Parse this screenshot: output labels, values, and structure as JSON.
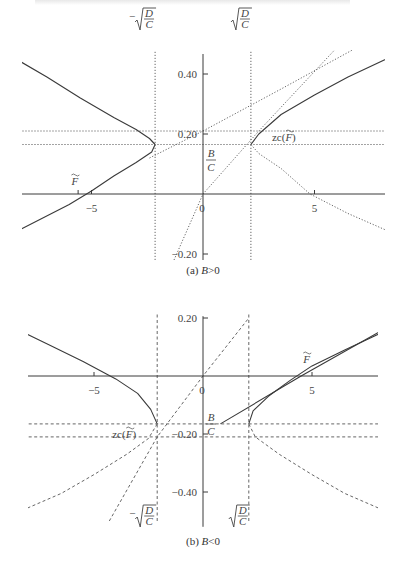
{
  "header_text_fragment": "",
  "chart_data": [
    {
      "type": "line",
      "panel": "a",
      "caption": "(a) B>0",
      "caption_prefix": "(a) ",
      "caption_var": "B",
      "caption_rel": ">0",
      "xlim": [
        -8.5,
        8.5
      ],
      "ylim": [
        -0.22,
        0.48
      ],
      "x_ticks": [
        -5,
        0,
        5
      ],
      "x_tick_labels": [
        "−5",
        "0",
        "5"
      ],
      "y_ticks": [
        0.4,
        0.2,
        -0.2
      ],
      "y_tick_labels": [
        "0.40",
        "0.20",
        "−0.20"
      ],
      "params": {
        "sqrtDC": 2.15,
        "BC": 0.165,
        "zc_y": 0.21
      },
      "annotations": {
        "neg_sqrt": "−√(D/C)",
        "pos_sqrt": "√(D/C)",
        "BC_num": "B",
        "BC_den": "C",
        "zc": "zc(F̃)",
        "Ftilde": "F̃"
      },
      "series": [
        {
          "name": "hyperbola-left-solid",
          "style": "solid",
          "points": [
            [
              -8.5,
              0.455
            ],
            [
              -7,
              0.39
            ],
            [
              -5.5,
              0.32
            ],
            [
              -4,
              0.255
            ],
            [
              -3,
              0.215
            ],
            [
              -2.4,
              0.185
            ],
            [
              -2.15,
              0.165
            ]
          ]
        },
        {
          "name": "hyperbola-left-lower",
          "style": "mixed",
          "points": [
            [
              -2.15,
              0.165
            ],
            [
              -2.3,
              0.14
            ],
            [
              -3,
              0.105
            ],
            [
              -4,
              0.06
            ],
            [
              -5,
              0.01
            ],
            [
              -6,
              -0.035
            ],
            [
              -8.5,
              -0.13
            ]
          ]
        },
        {
          "name": "hyperbola-right-solid",
          "style": "solid",
          "points": [
            [
              2.15,
              0.165
            ],
            [
              2.5,
              0.2
            ],
            [
              3.5,
              0.265
            ],
            [
              5,
              0.33
            ],
            [
              6.5,
              0.39
            ],
            [
              8.5,
              0.46
            ]
          ]
        },
        {
          "name": "hyperbola-right-lower",
          "style": "dotted",
          "points": [
            [
              2.15,
              0.165
            ],
            [
              2.5,
              0.135
            ],
            [
              3.5,
              0.085
            ],
            [
              4.8,
              0.0
            ],
            [
              6.5,
              -0.065
            ],
            [
              8.5,
              -0.13
            ]
          ]
        },
        {
          "name": "tangent-line-steep",
          "style": "dotted",
          "points": [
            [
              -1.3,
              -0.22
            ],
            [
              0,
              0
            ],
            [
              2.5,
              0.21
            ],
            [
              5.9,
              0.48
            ]
          ]
        },
        {
          "name": "tangent-line-shallow",
          "style": "dotted",
          "points": [
            [
              -2.4,
              0.12
            ],
            [
              0,
              0.21
            ],
            [
              3.5,
              0.35
            ],
            [
              6.7,
              0.48
            ]
          ]
        },
        {
          "name": "hline-zc",
          "style": "dotted",
          "points": [
            [
              -8.5,
              0.21
            ],
            [
              8.5,
              0.21
            ]
          ]
        },
        {
          "name": "hline-BC",
          "style": "dotted",
          "points": [
            [
              -8.5,
              0.165
            ],
            [
              8.5,
              0.165
            ]
          ]
        },
        {
          "name": "vline-neg-sqrt",
          "style": "dotted",
          "points": [
            [
              -2.15,
              -0.22
            ],
            [
              -2.15,
              0.48
            ]
          ]
        },
        {
          "name": "vline-pos-sqrt",
          "style": "dotted",
          "points": [
            [
              2.15,
              -0.22
            ],
            [
              2.15,
              0.48
            ]
          ]
        }
      ]
    },
    {
      "type": "line",
      "panel": "b",
      "caption": "(b) B<0",
      "caption_prefix": "(b) ",
      "caption_var": "B",
      "caption_rel": "<0",
      "xlim": [
        -8.5,
        8.5
      ],
      "ylim": [
        -0.52,
        0.22
      ],
      "x_ticks": [
        -5,
        0,
        5
      ],
      "x_tick_labels": [
        "−5",
        "0",
        "5"
      ],
      "y_ticks": [
        0.2,
        -0.2,
        -0.4
      ],
      "y_tick_labels": [
        "0.20",
        "−0.20",
        "−0.40"
      ],
      "params": {
        "sqrtDC": 2.1,
        "BC": -0.165,
        "zc_y": -0.21
      },
      "annotations": {
        "neg_sqrt": "−√(D/C)",
        "pos_sqrt": "√(D/C)",
        "BC_num": "B",
        "BC_den": "C",
        "zc": "zc(F̃)",
        "Ftilde": "F̃"
      },
      "series": [
        {
          "name": "hyperbola-left-solid",
          "style": "solid",
          "points": [
            [
              -8.5,
              0.16
            ],
            [
              -7,
              0.105
            ],
            [
              -5.5,
              0.05
            ],
            [
              -4,
              -0.01
            ],
            [
              -3,
              -0.06
            ],
            [
              -2.4,
              -0.115
            ],
            [
              -2.1,
              -0.165
            ]
          ]
        },
        {
          "name": "hyperbola-left-lower",
          "style": "dashed",
          "points": [
            [
              -2.1,
              -0.165
            ],
            [
              -2.5,
              -0.215
            ],
            [
              -3.5,
              -0.27
            ],
            [
              -5,
              -0.34
            ],
            [
              -6.5,
              -0.405
            ],
            [
              -8.5,
              -0.47
            ]
          ]
        },
        {
          "name": "hyperbola-right-solid",
          "style": "solid",
          "points": [
            [
              2.1,
              -0.165
            ],
            [
              2.3,
              -0.12
            ],
            [
              3,
              -0.07
            ],
            [
              4,
              -0.015
            ],
            [
              5,
              0.035
            ],
            [
              6.5,
              0.09
            ],
            [
              8.5,
              0.16
            ]
          ]
        },
        {
          "name": "hyperbola-right-lower",
          "style": "dashed",
          "points": [
            [
              2.1,
              -0.165
            ],
            [
              2.4,
              -0.21
            ],
            [
              3.5,
              -0.27
            ],
            [
              5,
              -0.34
            ],
            [
              6.5,
              -0.405
            ],
            [
              8.5,
              -0.47
            ]
          ]
        },
        {
          "name": "tangent-line-steep",
          "style": "dashed",
          "points": [
            [
              -4.3,
              -0.5
            ],
            [
              -2.1,
              -0.21
            ],
            [
              0,
              0
            ],
            [
              2.1,
              0.2
            ]
          ]
        },
        {
          "name": "tangent-line-solid",
          "style": "solid",
          "points": [
            [
              0.8,
              -0.165
            ],
            [
              4.5,
              0.0
            ],
            [
              8.5,
              0.17
            ]
          ]
        },
        {
          "name": "hline-BC",
          "style": "dashed",
          "points": [
            [
              -8.5,
              -0.165
            ],
            [
              8.5,
              -0.165
            ]
          ]
        },
        {
          "name": "hline-zc",
          "style": "dashed",
          "points": [
            [
              -8.5,
              -0.21
            ],
            [
              8.5,
              -0.21
            ]
          ]
        },
        {
          "name": "vline-neg-sqrt",
          "style": "dashed",
          "points": [
            [
              -2.1,
              -0.5
            ],
            [
              -2.1,
              0.22
            ]
          ]
        },
        {
          "name": "vline-pos-sqrt",
          "style": "dashed",
          "points": [
            [
              2.1,
              -0.5
            ],
            [
              2.1,
              0.22
            ]
          ]
        }
      ]
    }
  ]
}
